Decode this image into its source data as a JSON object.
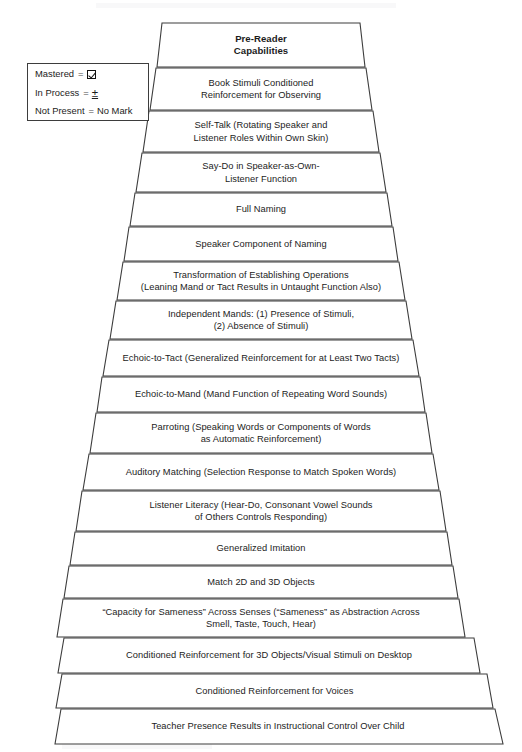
{
  "diagram": {
    "type": "pyramid",
    "title": "Pre-Reader Capabilities",
    "orientation": "apex-top",
    "level_count": 17,
    "colors": {
      "band_fill": "#ffffff",
      "band_stroke": "#3d3d3d",
      "text": "#1c1c1c",
      "background": "#ffffff"
    }
  },
  "legend": {
    "rows": [
      {
        "term": "Mastered",
        "equals": "=",
        "value": "☑",
        "value_kind": "checkbox-checked-icon"
      },
      {
        "term": "In Process",
        "equals": "=",
        "value": "±",
        "value_kind": "plus-minus-symbol"
      },
      {
        "term": "Not Present",
        "equals": "=",
        "value": "No Mark",
        "value_kind": "text"
      }
    ]
  },
  "levels": [
    {
      "index": 1,
      "label": "Pre-Reader\nCapabilities",
      "emphasis": "bold"
    },
    {
      "index": 2,
      "label": "Book Stimuli Conditioned\nReinforcement for Observing",
      "emphasis": "normal"
    },
    {
      "index": 3,
      "label": "Self-Talk (Rotating Speaker and\nListener Roles Within Own Skin)",
      "emphasis": "normal"
    },
    {
      "index": 4,
      "label": "Say-Do in Speaker-as-Own-\nListener Function",
      "emphasis": "normal"
    },
    {
      "index": 5,
      "label": "Full Naming",
      "emphasis": "normal"
    },
    {
      "index": 6,
      "label": "Speaker Component of Naming",
      "emphasis": "normal"
    },
    {
      "index": 7,
      "label": "Transformation of Establishing Operations\n(Leaning Mand or Tact Results in Untaught Function Also)",
      "emphasis": "normal"
    },
    {
      "index": 8,
      "label": "Independent Mands: (1) Presence of Stimuli,\n(2) Absence of Stimuli)",
      "emphasis": "normal"
    },
    {
      "index": 9,
      "label": "Echoic-to-Tact (Generalized Reinforcement for at Least Two Tacts)",
      "emphasis": "normal"
    },
    {
      "index": 10,
      "label": "Echoic-to-Mand (Mand Function of Repeating Word Sounds)",
      "emphasis": "normal"
    },
    {
      "index": 11,
      "label": "Parroting (Speaking Words or Components of Words\nas Automatic Reinforcement)",
      "emphasis": "normal"
    },
    {
      "index": 12,
      "label": "Auditory Matching (Selection Response to Match Spoken Words)",
      "emphasis": "normal"
    },
    {
      "index": 13,
      "label": "Listener Literacy (Hear-Do, Consonant Vowel Sounds\nof Others Controls Responding)",
      "emphasis": "normal"
    },
    {
      "index": 14,
      "label": "Generalized Imitation",
      "emphasis": "normal"
    },
    {
      "index": 15,
      "label": "Match 2D and 3D Objects",
      "emphasis": "normal"
    },
    {
      "index": 16,
      "label": "“Capacity for Sameness” Across Senses (“Sameness” as Abstraction Across\nSmell, Taste, Touch, Hear)",
      "emphasis": "normal"
    },
    {
      "index": 17,
      "label": "Conditioned Reinforcement for 3D Objects/Visual Stimuli on Desktop",
      "emphasis": "normal"
    },
    {
      "index": 18,
      "label": "Conditioned Reinforcement for Voices",
      "emphasis": "normal"
    },
    {
      "index": 19,
      "label": "Teacher Presence Results in Instructional Control Over Child",
      "emphasis": "normal"
    }
  ],
  "geometry": {
    "note": "per-band trapezoid corner x positions and vertical extents in page pixels",
    "bands": [
      {
        "y_top": 23,
        "y_bot": 67,
        "x_tl": 162,
        "x_tr": 360,
        "x_bl": 157,
        "x_br": 365
      },
      {
        "y_top": 68,
        "y_bot": 110,
        "x_tl": 156,
        "x_tr": 366,
        "x_bl": 150,
        "x_br": 372
      },
      {
        "y_top": 111,
        "y_bot": 152,
        "x_tl": 149,
        "x_tr": 373,
        "x_bl": 143,
        "x_br": 379
      },
      {
        "y_top": 153,
        "y_bot": 192,
        "x_tl": 142,
        "x_tr": 380,
        "x_bl": 136,
        "x_br": 386
      },
      {
        "y_top": 193,
        "y_bot": 226,
        "x_tl": 135,
        "x_tr": 387,
        "x_bl": 130,
        "x_br": 392
      },
      {
        "y_top": 227,
        "y_bot": 261,
        "x_tl": 129,
        "x_tr": 393,
        "x_bl": 124,
        "x_br": 398
      },
      {
        "y_top": 262,
        "y_bot": 300,
        "x_tl": 123,
        "x_tr": 399,
        "x_bl": 117,
        "x_br": 405
      },
      {
        "y_top": 301,
        "y_bot": 339,
        "x_tl": 116,
        "x_tr": 406,
        "x_bl": 110,
        "x_br": 412
      },
      {
        "y_top": 340,
        "y_bot": 376,
        "x_tl": 109,
        "x_tr": 413,
        "x_bl": 103,
        "x_br": 419
      },
      {
        "y_top": 377,
        "y_bot": 412,
        "x_tl": 102,
        "x_tr": 420,
        "x_bl": 97,
        "x_br": 425
      },
      {
        "y_top": 413,
        "y_bot": 453,
        "x_tl": 96,
        "x_tr": 426,
        "x_bl": 90,
        "x_br": 432
      },
      {
        "y_top": 454,
        "y_bot": 490,
        "x_tl": 89,
        "x_tr": 433,
        "x_bl": 83,
        "x_br": 439
      },
      {
        "y_top": 491,
        "y_bot": 531,
        "x_tl": 82,
        "x_tr": 440,
        "x_bl": 76,
        "x_br": 446
      },
      {
        "y_top": 532,
        "y_bot": 565,
        "x_tl": 75,
        "x_tr": 447,
        "x_bl": 70,
        "x_br": 452
      },
      {
        "y_top": 566,
        "y_bot": 598,
        "x_tl": 69,
        "x_tr": 453,
        "x_bl": 64,
        "x_br": 458
      },
      {
        "y_top": 599,
        "y_bot": 637,
        "x_tl": 63,
        "x_tr": 459,
        "x_bl": 57,
        "x_br": 465
      },
      {
        "y_top": 638,
        "y_bot": 673,
        "x_tl": 64,
        "x_tr": 474,
        "x_bl": 58,
        "x_br": 480
      },
      {
        "y_top": 674,
        "y_bot": 708,
        "x_tl": 62,
        "x_tr": 487,
        "x_bl": 56,
        "x_br": 493
      },
      {
        "y_top": 709,
        "y_bot": 744,
        "x_tl": 61,
        "x_tr": 495,
        "x_bl": 55,
        "x_br": 503
      }
    ]
  }
}
